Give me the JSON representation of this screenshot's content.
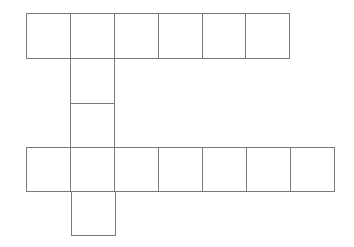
{
  "diagram": {
    "title": "",
    "line_color": "#7a7a7a",
    "background": "#ffffff",
    "cell_size": 45,
    "cells": [
      {
        "id": "top-1",
        "x": 26,
        "y": 13,
        "w": 45,
        "h": 46
      },
      {
        "id": "top-2",
        "x": 70,
        "y": 13,
        "w": 45,
        "h": 46
      },
      {
        "id": "top-3",
        "x": 114,
        "y": 13,
        "w": 45,
        "h": 46
      },
      {
        "id": "top-4",
        "x": 158,
        "y": 13,
        "w": 45,
        "h": 46
      },
      {
        "id": "top-5",
        "x": 202,
        "y": 13,
        "w": 44,
        "h": 46
      },
      {
        "id": "top-6",
        "x": 245,
        "y": 13,
        "w": 45,
        "h": 46
      },
      {
        "id": "mid-1",
        "x": 70,
        "y": 58,
        "w": 45,
        "h": 46
      },
      {
        "id": "mid-2",
        "x": 70,
        "y": 103,
        "w": 45,
        "h": 45
      },
      {
        "id": "bot-1",
        "x": 26,
        "y": 147,
        "w": 45,
        "h": 45
      },
      {
        "id": "bot-2",
        "x": 70,
        "y": 147,
        "w": 45,
        "h": 45
      },
      {
        "id": "bot-3",
        "x": 114,
        "y": 147,
        "w": 45,
        "h": 45
      },
      {
        "id": "bot-4",
        "x": 158,
        "y": 147,
        "w": 45,
        "h": 45
      },
      {
        "id": "bot-5",
        "x": 202,
        "y": 147,
        "w": 45,
        "h": 45
      },
      {
        "id": "bot-6",
        "x": 246,
        "y": 147,
        "w": 45,
        "h": 45
      },
      {
        "id": "bot-7",
        "x": 290,
        "y": 147,
        "w": 45,
        "h": 45
      },
      {
        "id": "tail-1",
        "x": 71,
        "y": 191,
        "w": 45,
        "h": 45
      }
    ]
  }
}
